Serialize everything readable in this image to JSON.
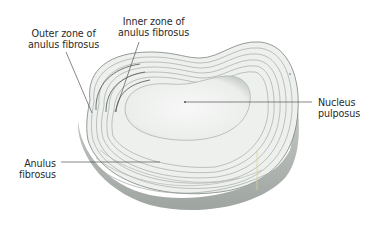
{
  "figure": {
    "colors": {
      "background": "#ffffff",
      "disc_fill": "#e9ecea",
      "ring_stroke": "#9aa29d",
      "ring_dark": "#5f6762",
      "nucleus_fill": "#f3f5f3",
      "leader_line": "#555555",
      "label_text": "#2a2a2a"
    }
  },
  "labels": {
    "outer_zone": {
      "line1": "Outer zone of",
      "line2": "anulus fibrosus"
    },
    "inner_zone": {
      "line1": "Inner zone of",
      "line2": "anulus fibrosus"
    },
    "nucleus": {
      "line1": "Nucleus",
      "line2": "pulposus"
    },
    "anulus": {
      "line1": "Anulus",
      "line2": "fibrosus"
    }
  }
}
